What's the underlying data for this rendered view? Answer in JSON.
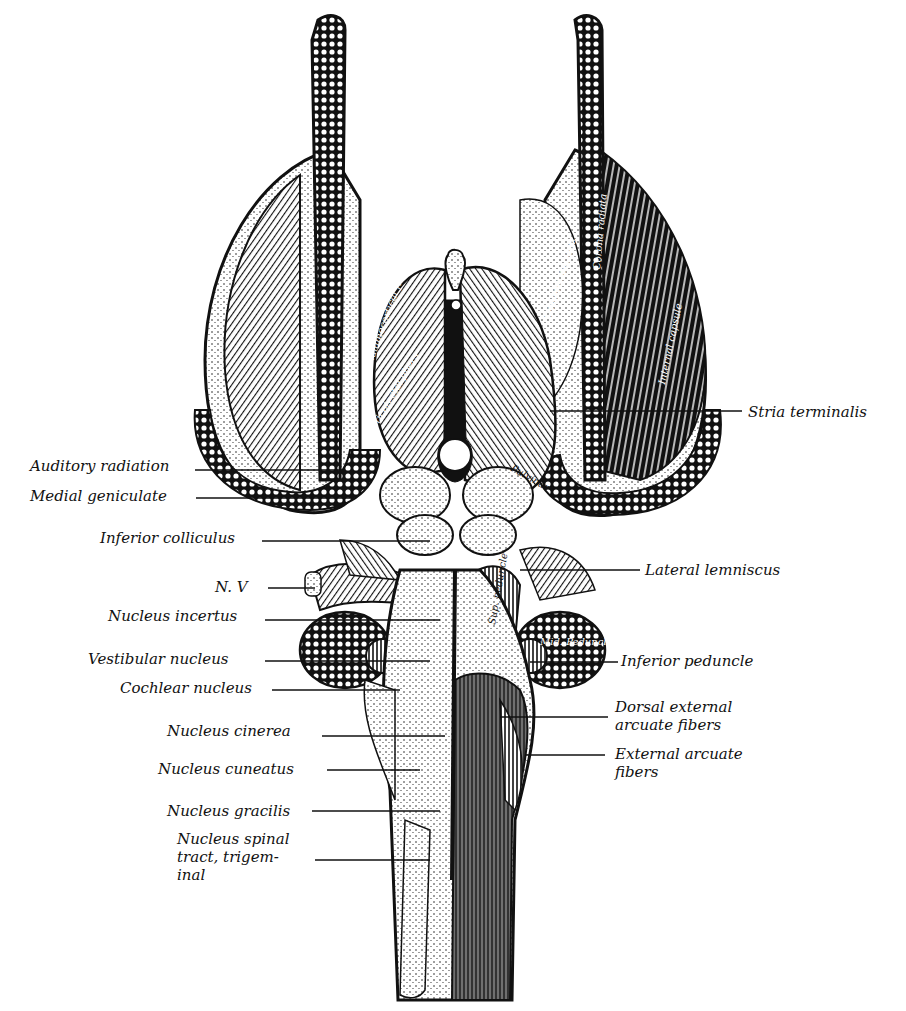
{
  "figure": {
    "colors": {
      "ink": "#111111",
      "paper": "#ffffff"
    }
  },
  "labels_left": [
    {
      "text": "Auditory radiation",
      "x": 30,
      "y": 457,
      "line_to": [
        345,
        470
      ]
    },
    {
      "text": "Medial geniculate",
      "x": 30,
      "y": 487,
      "line_to": [
        350,
        498
      ]
    },
    {
      "text": "Inferior colliculus",
      "x": 100,
      "y": 527,
      "line_to": [
        430,
        541
      ]
    },
    {
      "text": "N. V",
      "x": 215,
      "y": 578,
      "line_to": [
        315,
        588
      ]
    },
    {
      "text": "Nucleus incertus",
      "x": 108,
      "y": 607,
      "line_to": [
        440,
        620
      ]
    },
    {
      "text": "Vestibular nucleus",
      "x": 88,
      "y": 650,
      "line_to": [
        430,
        661
      ]
    },
    {
      "text": "Cochlear nucleus",
      "x": 120,
      "y": 679,
      "line_to": [
        400,
        690
      ]
    },
    {
      "text": "Nucleus cinerea",
      "x": 167,
      "y": 722,
      "line_to": [
        445,
        736
      ]
    },
    {
      "text": "Nucleus cuneatus",
      "x": 158,
      "y": 760,
      "line_to": [
        420,
        770
      ]
    },
    {
      "text": "Nucleus gracilis",
      "x": 167,
      "y": 802,
      "line_to": [
        440,
        811
      ]
    },
    {
      "text": "Nucleus spinal\ntract, trigem-\ninal",
      "x": 177,
      "y": 830,
      "line_to": [
        430,
        860
      ]
    }
  ],
  "labels_right": [
    {
      "text": "Stria terminalis",
      "x": 748,
      "y": 403,
      "line_from": [
        550,
        411
      ]
    },
    {
      "text": "Lateral lemniscus",
      "x": 645,
      "y": 561,
      "line_from": [
        520,
        570
      ]
    },
    {
      "text": "Inferior peduncle",
      "x": 621,
      "y": 652,
      "line_from": [
        530,
        662
      ]
    },
    {
      "text": "Dorsal external\narcuate fibers",
      "x": 615,
      "y": 698,
      "line_from": [
        500,
        717
      ]
    },
    {
      "text": "External arcuate\nfibers",
      "x": 615,
      "y": 745,
      "line_from": [
        525,
        755
      ]
    }
  ],
  "inner_labels": [
    {
      "text": "Caudate nucleus",
      "x": 550,
      "y": 320,
      "rotate": -72
    },
    {
      "text": "Corona radiata",
      "x": 600,
      "y": 270,
      "rotate": -85
    },
    {
      "text": "Internal capsule",
      "x": 665,
      "y": 385,
      "rotate": -78
    },
    {
      "text": "Thalamocortical fibers",
      "x": 370,
      "y": 370,
      "rotate": -70
    },
    {
      "text": "Corticotectal fibers",
      "x": 370,
      "y": 440,
      "rotate": -60
    },
    {
      "text": "Pulvinar",
      "x": 530,
      "y": 480,
      "rotate": 30
    },
    {
      "text": "Sup. peduncle",
      "x": 495,
      "y": 625,
      "rotate": -80
    },
    {
      "text": "Mid. Peduncle",
      "x": 560,
      "y": 645,
      "rotate": 0
    }
  ]
}
